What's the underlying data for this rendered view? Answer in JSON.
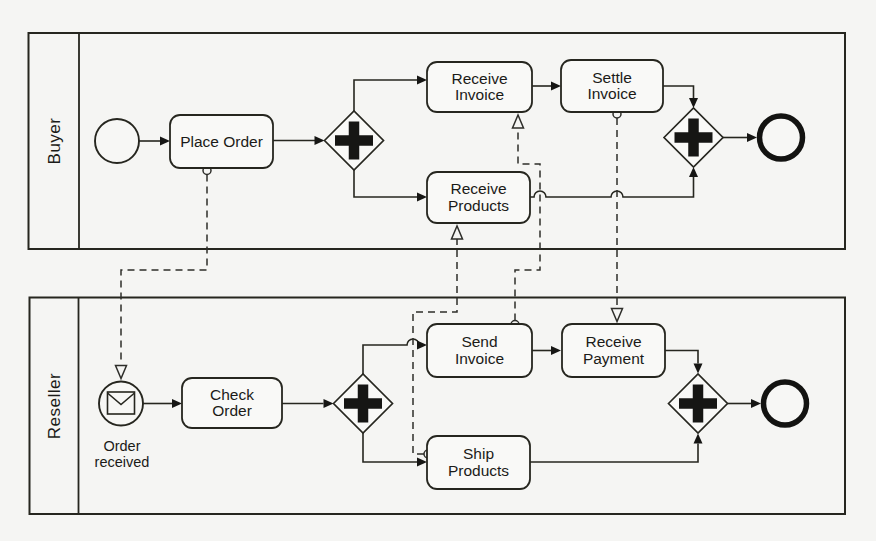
{
  "diagram_type": "BPMN collaboration diagram",
  "colors": {
    "background": "#f5f5f3",
    "stroke": "#26261f",
    "shape_fill": "#f9f9f7",
    "text": "#1b1b18"
  },
  "pools": [
    {
      "name": "Buyer",
      "elements": {
        "start_event": {
          "kind": "start-event"
        },
        "place_order": {
          "label": "Place Order"
        },
        "parallel_split": {
          "kind": "parallel-gateway",
          "symbol": "+"
        },
        "receive_invoice": {
          "label_lines": [
            "Receive",
            "Invoice"
          ]
        },
        "settle_invoice": {
          "label_lines": [
            "Settle",
            "Invoice"
          ]
        },
        "receive_products": {
          "label_lines": [
            "Receive",
            "Products"
          ]
        },
        "parallel_join": {
          "kind": "parallel-gateway",
          "symbol": "+"
        },
        "end_event": {
          "kind": "end-event"
        }
      }
    },
    {
      "name": "Reseller",
      "elements": {
        "order_received_event": {
          "kind": "message-start-event",
          "label_lines": [
            "Order",
            "received"
          ]
        },
        "check_order": {
          "label_lines": [
            "Check",
            "Order"
          ]
        },
        "parallel_split": {
          "kind": "parallel-gateway",
          "symbol": "+"
        },
        "send_invoice": {
          "label_lines": [
            "Send",
            "Invoice"
          ]
        },
        "receive_payment": {
          "label_lines": [
            "Receive",
            "Payment"
          ]
        },
        "ship_products": {
          "label_lines": [
            "Ship",
            "Products"
          ]
        },
        "parallel_join": {
          "kind": "parallel-gateway",
          "symbol": "+"
        },
        "end_event": {
          "kind": "end-event"
        }
      }
    }
  ],
  "sequence_flows": [
    {
      "pool": "Buyer",
      "from": "start-event",
      "to": "Place Order"
    },
    {
      "pool": "Buyer",
      "from": "Place Order",
      "to": "parallel-split"
    },
    {
      "pool": "Buyer",
      "from": "parallel-split",
      "to": "Receive Invoice"
    },
    {
      "pool": "Buyer",
      "from": "parallel-split",
      "to": "Receive Products"
    },
    {
      "pool": "Buyer",
      "from": "Receive Invoice",
      "to": "Settle Invoice"
    },
    {
      "pool": "Buyer",
      "from": "Settle Invoice",
      "to": "parallel-join"
    },
    {
      "pool": "Buyer",
      "from": "Receive Products",
      "to": "parallel-join"
    },
    {
      "pool": "Buyer",
      "from": "parallel-join",
      "to": "end-event"
    },
    {
      "pool": "Reseller",
      "from": "Order received",
      "to": "Check Order"
    },
    {
      "pool": "Reseller",
      "from": "Check Order",
      "to": "parallel-split"
    },
    {
      "pool": "Reseller",
      "from": "parallel-split",
      "to": "Send Invoice"
    },
    {
      "pool": "Reseller",
      "from": "parallel-split",
      "to": "Ship Products"
    },
    {
      "pool": "Reseller",
      "from": "Send Invoice",
      "to": "Receive Payment"
    },
    {
      "pool": "Reseller",
      "from": "Receive Payment",
      "to": "parallel-join"
    },
    {
      "pool": "Reseller",
      "from": "Ship Products",
      "to": "parallel-join"
    },
    {
      "pool": "Reseller",
      "from": "parallel-join",
      "to": "end-event"
    }
  ],
  "message_flows": [
    {
      "from": "Place Order",
      "to": "Order received"
    },
    {
      "from": "Send Invoice",
      "to": "Receive Invoice"
    },
    {
      "from": "Settle Invoice",
      "to": "Receive Payment"
    },
    {
      "from": "Ship Products",
      "to": "Receive Products"
    }
  ]
}
